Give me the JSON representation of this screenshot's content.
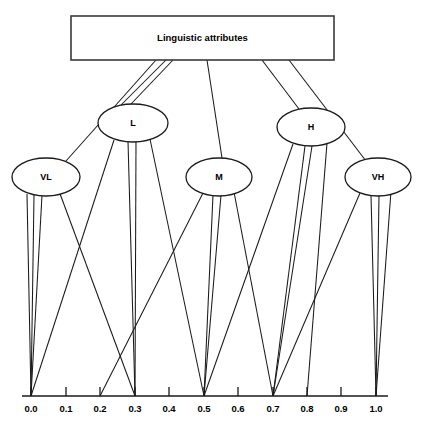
{
  "figure": {
    "type": "diagram",
    "subtype": "fuzzy-membership-tree",
    "background_color": "#ffffff",
    "line_color": "#1a1a1a",
    "width": 427,
    "height": 433
  },
  "root": {
    "label": "Linguistic attributes",
    "shape": "rectangle",
    "x": 71,
    "y": 16,
    "width": 263,
    "height": 44
  },
  "nodes": [
    {
      "id": "VL",
      "label": "VL",
      "shape": "ellipse",
      "cx": 46,
      "cy": 177,
      "rx": 34,
      "ry": 19
    },
    {
      "id": "L",
      "label": "L",
      "shape": "ellipse",
      "cx": 133,
      "cy": 123,
      "rx": 35,
      "ry": 19
    },
    {
      "id": "M",
      "label": "M",
      "shape": "ellipse",
      "cx": 219,
      "cy": 177,
      "rx": 33,
      "ry": 19
    },
    {
      "id": "H",
      "label": "H",
      "shape": "ellipse",
      "cx": 311,
      "cy": 127,
      "rx": 34,
      "ry": 19
    },
    {
      "id": "VH",
      "label": "VH",
      "shape": "ellipse",
      "cx": 378,
      "cy": 177,
      "rx": 33,
      "ry": 19
    }
  ],
  "root_edges": [
    {
      "from": "root",
      "to": "VL",
      "x1": 156,
      "y1": 60,
      "x2": 66,
      "y2": 161
    },
    {
      "from": "root",
      "to": "L",
      "x1": 166,
      "y1": 60,
      "x2": 121,
      "y2": 105
    },
    {
      "from": "root",
      "to": "L",
      "x1": 173,
      "y1": 60,
      "x2": 131,
      "y2": 104
    },
    {
      "from": "root",
      "to": "M",
      "x1": 207,
      "y1": 60,
      "x2": 222,
      "y2": 158
    },
    {
      "from": "root",
      "to": "H",
      "x1": 262,
      "y1": 60,
      "x2": 299,
      "y2": 109
    },
    {
      "from": "root",
      "to": "VH",
      "x1": 289,
      "y1": 60,
      "x2": 366,
      "y2": 161
    }
  ],
  "axis": {
    "y": 396,
    "x_start": 22,
    "x_end": 388,
    "tick_height": 9,
    "ticks": [
      {
        "label": "0.0",
        "value": 0.0,
        "x": 31
      },
      {
        "label": "0.1",
        "value": 0.1,
        "x": 66
      },
      {
        "label": "0.2",
        "value": 0.2,
        "x": 100
      },
      {
        "label": "0.3",
        "value": 0.3,
        "x": 135
      },
      {
        "label": "0.4",
        "value": 0.4,
        "x": 169
      },
      {
        "label": "0.5",
        "value": 0.5,
        "x": 204
      },
      {
        "label": "0.6",
        "value": 0.6,
        "x": 238
      },
      {
        "label": "0.7",
        "value": 0.7,
        "x": 273
      },
      {
        "label": "0.8",
        "value": 0.8,
        "x": 307
      },
      {
        "label": "0.9",
        "value": 0.9,
        "x": 341
      },
      {
        "label": "1.0",
        "value": 1.0,
        "x": 376
      }
    ]
  },
  "leaf_edges": [
    {
      "from": "VL",
      "to": "0.0",
      "x1": 27,
      "y1": 194,
      "x2": 31,
      "y2": 396
    },
    {
      "from": "VL",
      "to": "0.0",
      "x1": 34,
      "y1": 195,
      "x2": 31,
      "y2": 396
    },
    {
      "from": "VL",
      "to": "0.0",
      "x1": 42,
      "y1": 195,
      "x2": 31,
      "y2": 396
    },
    {
      "from": "VL",
      "to": "0.3",
      "x1": 59,
      "y1": 191,
      "x2": 135,
      "y2": 396
    },
    {
      "from": "L",
      "to": "0.0",
      "x1": 114,
      "y1": 140,
      "x2": 31,
      "y2": 396
    },
    {
      "from": "L",
      "to": "0.3",
      "x1": 128,
      "y1": 141,
      "x2": 135,
      "y2": 396
    },
    {
      "from": "L",
      "to": "0.3",
      "x1": 136,
      "y1": 141,
      "x2": 135,
      "y2": 396
    },
    {
      "from": "L",
      "to": "0.5",
      "x1": 150,
      "y1": 139,
      "x2": 204,
      "y2": 396
    },
    {
      "from": "M",
      "to": "0.2",
      "x1": 203,
      "y1": 193,
      "x2": 100,
      "y2": 396
    },
    {
      "from": "M",
      "to": "0.5",
      "x1": 213,
      "y1": 195,
      "x2": 204,
      "y2": 396
    },
    {
      "from": "M",
      "to": "0.5",
      "x1": 221,
      "y1": 195,
      "x2": 204,
      "y2": 396
    },
    {
      "from": "M",
      "to": "0.7",
      "x1": 234,
      "y1": 192,
      "x2": 273,
      "y2": 396
    },
    {
      "from": "H",
      "to": "0.5",
      "x1": 293,
      "y1": 144,
      "x2": 204,
      "y2": 396
    },
    {
      "from": "H",
      "to": "0.7",
      "x1": 305,
      "y1": 146,
      "x2": 273,
      "y2": 396
    },
    {
      "from": "H",
      "to": "0.7",
      "x1": 312,
      "y1": 146,
      "x2": 273,
      "y2": 396
    },
    {
      "from": "H",
      "to": "0.8",
      "x1": 327,
      "y1": 143,
      "x2": 307,
      "y2": 396
    },
    {
      "from": "VH",
      "to": "0.7",
      "x1": 360,
      "y1": 193,
      "x2": 273,
      "y2": 396
    },
    {
      "from": "VH",
      "to": "1.0",
      "x1": 371,
      "y1": 195,
      "x2": 376,
      "y2": 396
    },
    {
      "from": "VH",
      "to": "1.0",
      "x1": 379,
      "y1": 195,
      "x2": 376,
      "y2": 396
    },
    {
      "from": "VH",
      "to": "1.0",
      "x1": 391,
      "y1": 191,
      "x2": 376,
      "y2": 396
    }
  ]
}
